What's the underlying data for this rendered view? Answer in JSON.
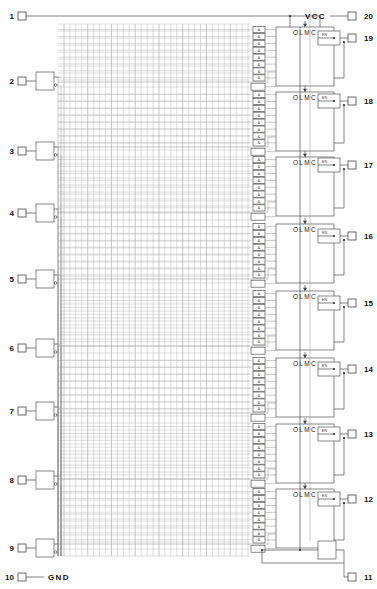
{
  "diagram": {
    "power_label": "VCC",
    "ground_label": "GND",
    "macrocell_label": "OLMC",
    "and_gate_symbol": "&",
    "buffer_symbol": "EN",
    "colors": {
      "wire": "#4a4a4a",
      "grid": "#8c8c8c",
      "box_stroke": "#555555",
      "text": "#111111",
      "background": "#ffffff"
    },
    "matrix": {
      "columns": 32,
      "rows": 64,
      "left": 58,
      "right": 252,
      "top": 24,
      "bottom": 556
    }
  },
  "left_pins": [
    {
      "number": "1",
      "y": 16,
      "type": "clock-input",
      "buffered": false
    },
    {
      "number": "2",
      "y": 81,
      "type": "input",
      "buffered": true
    },
    {
      "number": "3",
      "y": 151,
      "type": "input",
      "buffered": true
    },
    {
      "number": "4",
      "y": 213,
      "type": "input",
      "buffered": true
    },
    {
      "number": "5",
      "y": 279,
      "type": "input",
      "buffered": true
    },
    {
      "number": "6",
      "y": 348,
      "type": "input",
      "buffered": true
    },
    {
      "number": "7",
      "y": 411,
      "type": "input",
      "buffered": true
    },
    {
      "number": "8",
      "y": 480,
      "type": "input",
      "buffered": true
    },
    {
      "number": "9",
      "y": 548,
      "type": "input",
      "buffered": true
    },
    {
      "number": "10",
      "y": 577,
      "type": "ground",
      "buffered": false
    }
  ],
  "right_pins": [
    {
      "number": "20",
      "y": 16,
      "type": "power"
    },
    {
      "number": "19",
      "y": 38,
      "type": "io",
      "olmc": 1
    },
    {
      "number": "18",
      "y": 101,
      "type": "io",
      "olmc": 2
    },
    {
      "number": "17",
      "y": 165,
      "type": "io",
      "olmc": 3
    },
    {
      "number": "16",
      "y": 236,
      "type": "io",
      "olmc": 4
    },
    {
      "number": "15",
      "y": 303,
      "type": "io",
      "olmc": 5
    },
    {
      "number": "14",
      "y": 369,
      "type": "io",
      "olmc": 6
    },
    {
      "number": "13",
      "y": 434,
      "type": "io",
      "olmc": 7
    },
    {
      "number": "12",
      "y": 499,
      "type": "io",
      "olmc": 8
    },
    {
      "number": "11",
      "y": 577,
      "type": "output-enable"
    }
  ],
  "macrocells": [
    {
      "index": 1,
      "label": "OLMC",
      "y": 27,
      "height": 59,
      "and_gates": 8,
      "out_pin": "19"
    },
    {
      "index": 2,
      "label": "OLMC",
      "y": 92,
      "height": 59,
      "and_gates": 8,
      "out_pin": "18"
    },
    {
      "index": 3,
      "label": "OLMC",
      "y": 157,
      "height": 59,
      "and_gates": 8,
      "out_pin": "17"
    },
    {
      "index": 4,
      "label": "OLMC",
      "y": 224,
      "height": 59,
      "and_gates": 8,
      "out_pin": "16"
    },
    {
      "index": 5,
      "label": "OLMC",
      "y": 291,
      "height": 59,
      "and_gates": 8,
      "out_pin": "15"
    },
    {
      "index": 6,
      "label": "OLMC",
      "y": 358,
      "height": 59,
      "and_gates": 8,
      "out_pin": "14"
    },
    {
      "index": 7,
      "label": "OLMC",
      "y": 424,
      "height": 59,
      "and_gates": 8,
      "out_pin": "13"
    },
    {
      "index": 8,
      "label": "OLMC",
      "y": 489,
      "height": 59,
      "and_gates": 8,
      "out_pin": "12"
    }
  ]
}
